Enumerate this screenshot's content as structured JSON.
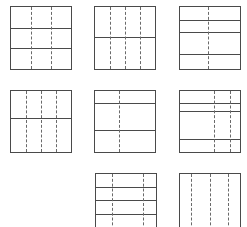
{
  "diagram": {
    "title": "",
    "line_color": "#4a4a4a",
    "dash_color": "#6a6a6a",
    "background": "#ffffff",
    "squares": [
      {
        "id": "r1c1",
        "x": 10,
        "y": 6,
        "w": 62,
        "h": 64,
        "dashed_x": [
          0.333,
          0.667
        ],
        "solid_y": [
          0.333,
          0.667
        ]
      },
      {
        "id": "r1c2",
        "x": 94,
        "y": 6,
        "w": 62,
        "h": 64,
        "dashed_x": [
          0.25,
          0.5,
          0.75
        ],
        "solid_y": [
          0.48
        ]
      },
      {
        "id": "r1c3",
        "x": 179,
        "y": 6,
        "w": 62,
        "h": 64,
        "dashed_x": [
          0.47
        ],
        "solid_y": [
          0.21,
          0.41,
          0.76
        ]
      },
      {
        "id": "r2c1",
        "x": 10,
        "y": 90,
        "w": 62,
        "h": 63,
        "dashed_x": [
          0.25,
          0.5,
          0.75
        ],
        "solid_y": [
          0.45
        ]
      },
      {
        "id": "r2c2",
        "x": 94,
        "y": 90,
        "w": 62,
        "h": 63,
        "dashed_x": [
          0.4
        ],
        "solid_y": [
          0.2,
          0.64
        ]
      },
      {
        "id": "r2c3",
        "x": 179,
        "y": 90,
        "w": 62,
        "h": 63,
        "dashed_x": [
          0.57,
          0.83
        ],
        "solid_y": [
          0.2,
          0.32,
          0.78
        ]
      },
      {
        "id": "r3c2",
        "x": 95,
        "y": 173,
        "w": 62,
        "h": 63,
        "dashed_x": [
          0.26,
          0.79
        ],
        "solid_y": [
          0.21,
          0.43,
          0.65
        ]
      },
      {
        "id": "r3c3",
        "x": 179,
        "y": 173,
        "w": 62,
        "h": 63,
        "dashed_x": [
          0.18,
          0.5,
          0.8
        ],
        "solid_y": []
      }
    ]
  }
}
